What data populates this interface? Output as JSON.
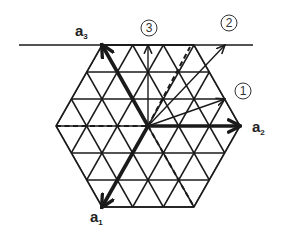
{
  "diagram": {
    "type": "hexagonal-lattice-vectors",
    "colors": {
      "line": "#1a1a1a",
      "background": "#ffffff"
    },
    "geometry": {
      "origin": [
        148,
        126
      ],
      "unit_a2": [
        30.67,
        0
      ],
      "unit_a3": [
        -15.33,
        -27
      ],
      "rows_y": [
        45,
        72,
        99,
        126,
        153,
        180,
        207
      ],
      "top_line": {
        "x1": 19,
        "x2": 253,
        "y": 45
      }
    },
    "basis_vectors": [
      {
        "id": "a1",
        "label": "a",
        "subscript": "1",
        "tip": [
          102,
          207
        ],
        "label_pos": [
          90,
          222
        ]
      },
      {
        "id": "a2",
        "label": "a",
        "subscript": "2",
        "tip": [
          240,
          126
        ],
        "label_pos": [
          252,
          132
        ]
      },
      {
        "id": "a3",
        "label": "a",
        "subscript": "3",
        "tip": [
          102,
          45
        ],
        "label_pos": [
          75,
          36
        ]
      }
    ],
    "numbered_vectors": [
      {
        "id": "1",
        "label": "1",
        "tip": [
          225,
          99
        ],
        "label_pos": [
          243,
          91
        ]
      },
      {
        "id": "2",
        "label": "2",
        "tip": [
          225,
          45
        ],
        "label_pos": [
          229,
          23
        ]
      },
      {
        "id": "3",
        "label": "3",
        "tip": [
          148,
          45
        ],
        "label_pos": [
          149,
          28
        ]
      }
    ],
    "dashed_lines": [
      {
        "from": [
          56,
          126
        ],
        "to": [
          148,
          126
        ]
      },
      {
        "from": [
          148,
          126
        ],
        "to": [
          190,
          47
        ]
      },
      {
        "from": [
          148,
          126
        ],
        "to": [
          194,
          207
        ]
      }
    ]
  }
}
